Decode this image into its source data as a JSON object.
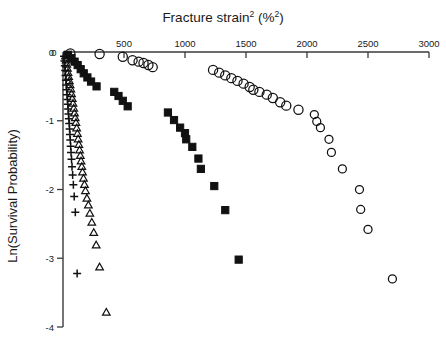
{
  "chart_data": {
    "type": "scatter",
    "title_base": "Fracture strain",
    "title_sup1": "2",
    "title_mid": " (%",
    "title_sup2": "2",
    "title_end": ")",
    "xlabel": "Fracture strain2 (%2)",
    "ylabel": "Ln(Survival Probability)",
    "xlabel_position": "top",
    "grid": false,
    "legend": "none",
    "xlim": [
      0,
      3000
    ],
    "ylim": [
      -4,
      0
    ],
    "xticks": [
      0,
      500,
      1000,
      1500,
      2000,
      2500,
      3000
    ],
    "xtick_labels": [
      "0",
      "500",
      "1000",
      "1500",
      "2000",
      "2500",
      "3000"
    ],
    "yticks": [
      0,
      -1,
      -2,
      -3,
      -4
    ],
    "ytick_labels": [
      "0",
      "-1",
      "-2",
      "-3",
      "-4"
    ],
    "marker_colors": {
      "plus": "#000000",
      "triangle": "#000000",
      "square": "#000000",
      "circle": "#000000"
    },
    "series": [
      {
        "name": "plus-series",
        "marker": "plus",
        "fill": "none",
        "points": [
          [
            8,
            -0.06
          ],
          [
            12,
            -0.13
          ],
          [
            15,
            -0.2
          ],
          [
            18,
            -0.27
          ],
          [
            21,
            -0.34
          ],
          [
            24,
            -0.41
          ],
          [
            27,
            -0.48
          ],
          [
            30,
            -0.55
          ],
          [
            33,
            -0.62
          ],
          [
            36,
            -0.69
          ],
          [
            39,
            -0.76
          ],
          [
            42,
            -0.83
          ],
          [
            45,
            -0.9
          ],
          [
            48,
            -0.97
          ],
          [
            51,
            -1.04
          ],
          [
            54,
            -1.12
          ],
          [
            57,
            -1.2
          ],
          [
            60,
            -1.28
          ],
          [
            63,
            -1.37
          ],
          [
            66,
            -1.46
          ],
          [
            70,
            -1.56
          ],
          [
            74,
            -1.67
          ],
          [
            79,
            -1.79
          ],
          [
            85,
            -1.93
          ],
          [
            92,
            -2.1
          ],
          [
            101,
            -2.33
          ],
          [
            116,
            -3.22
          ]
        ]
      },
      {
        "name": "triangle-series",
        "marker": "triangle",
        "fill": "none",
        "points": [
          [
            20,
            -0.05
          ],
          [
            26,
            -0.11
          ],
          [
            31,
            -0.17
          ],
          [
            36,
            -0.23
          ],
          [
            41,
            -0.29
          ],
          [
            46,
            -0.35
          ],
          [
            52,
            -0.41
          ],
          [
            58,
            -0.47
          ],
          [
            64,
            -0.53
          ],
          [
            70,
            -0.6
          ],
          [
            76,
            -0.67
          ],
          [
            82,
            -0.74
          ],
          [
            88,
            -0.81
          ],
          [
            94,
            -0.88
          ],
          [
            100,
            -0.95
          ],
          [
            106,
            -1.02
          ],
          [
            112,
            -1.1
          ],
          [
            118,
            -1.18
          ],
          [
            124,
            -1.26
          ],
          [
            130,
            -1.34
          ],
          [
            136,
            -1.42
          ],
          [
            142,
            -1.5
          ],
          [
            148,
            -1.58
          ],
          [
            154,
            -1.66
          ],
          [
            160,
            -1.74
          ],
          [
            168,
            -1.83
          ],
          [
            176,
            -1.92
          ],
          [
            184,
            -2.01
          ],
          [
            196,
            -2.12
          ],
          [
            208,
            -2.22
          ],
          [
            220,
            -2.34
          ],
          [
            236,
            -2.47
          ],
          [
            252,
            -2.62
          ],
          [
            272,
            -2.8
          ],
          [
            300,
            -3.12
          ],
          [
            355,
            -3.78
          ]
        ]
      },
      {
        "name": "square-series",
        "marker": "square",
        "fill": "solid",
        "points": [
          [
            40,
            -0.04
          ],
          [
            70,
            -0.09
          ],
          [
            95,
            -0.14
          ],
          [
            120,
            -0.19
          ],
          [
            145,
            -0.25
          ],
          [
            170,
            -0.31
          ],
          [
            200,
            -0.37
          ],
          [
            230,
            -0.43
          ],
          [
            275,
            -0.5
          ],
          [
            420,
            -0.58
          ],
          [
            455,
            -0.64
          ],
          [
            490,
            -0.71
          ],
          [
            530,
            -0.79
          ],
          [
            860,
            -0.88
          ],
          [
            910,
            -0.99
          ],
          [
            960,
            -1.1
          ],
          [
            1000,
            -1.18
          ],
          [
            1010,
            -1.27
          ],
          [
            1060,
            -1.38
          ],
          [
            1110,
            -1.55
          ],
          [
            1130,
            -1.7
          ],
          [
            1240,
            -1.95
          ],
          [
            1330,
            -2.3
          ],
          [
            1440,
            -3.02
          ]
        ]
      },
      {
        "name": "circle-series",
        "marker": "circle",
        "fill": "none",
        "points": [
          [
            60,
            -0.02
          ],
          [
            300,
            -0.03
          ],
          [
            490,
            -0.07
          ],
          [
            570,
            -0.12
          ],
          [
            620,
            -0.14
          ],
          [
            660,
            -0.16
          ],
          [
            700,
            -0.19
          ],
          [
            735,
            -0.22
          ],
          [
            1230,
            -0.26
          ],
          [
            1280,
            -0.3
          ],
          [
            1330,
            -0.34
          ],
          [
            1380,
            -0.38
          ],
          [
            1430,
            -0.42
          ],
          [
            1480,
            -0.46
          ],
          [
            1530,
            -0.51
          ],
          [
            1560,
            -0.55
          ],
          [
            1610,
            -0.58
          ],
          [
            1670,
            -0.62
          ],
          [
            1720,
            -0.67
          ],
          [
            1780,
            -0.73
          ],
          [
            1830,
            -0.78
          ],
          [
            1930,
            -0.84
          ],
          [
            2060,
            -0.91
          ],
          [
            2080,
            -1.01
          ],
          [
            2110,
            -1.1
          ],
          [
            2180,
            -1.27
          ],
          [
            2200,
            -1.46
          ],
          [
            2290,
            -1.7
          ],
          [
            2430,
            -2.0
          ],
          [
            2440,
            -2.29
          ],
          [
            2500,
            -2.58
          ],
          [
            2700,
            -3.3
          ]
        ]
      }
    ]
  },
  "axes": {
    "x_axis_name": "top-x-axis",
    "y_axis_name": "left-y-axis"
  }
}
